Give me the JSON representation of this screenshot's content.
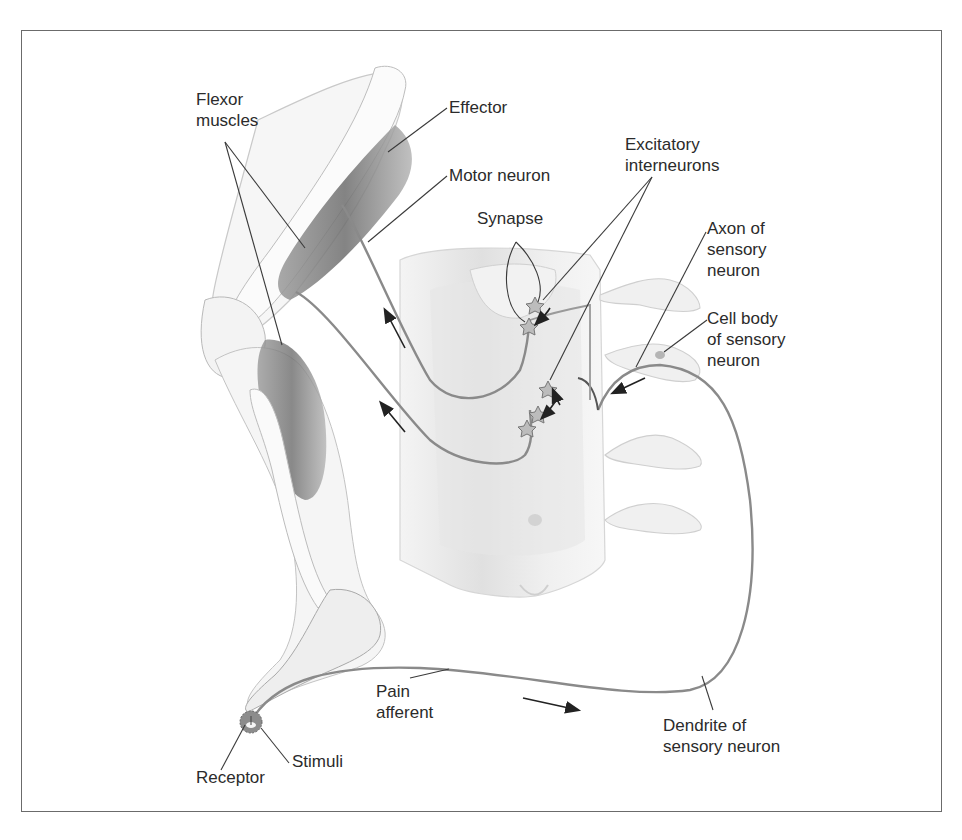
{
  "diagram": {
    "colors": {
      "frame": "#6b6b6b",
      "text": "#2b2b2b",
      "leader_line": "#3a3a3a",
      "neuron_path": "#8a8a8a",
      "muscle": "#7a7a7a",
      "bone": "#f2f2f2",
      "spinal_cord": "#ececec",
      "arrow": "#222222"
    },
    "labels": {
      "flexor_muscles_1": "Flexor",
      "flexor_muscles_2": "muscles",
      "effector": "Effector",
      "motor_neuron": "Motor neuron",
      "excitatory_1": "Excitatory",
      "excitatory_2": "interneurons",
      "synapse": "Synapse",
      "axon_1": "Axon of",
      "axon_2": "sensory",
      "axon_3": "neuron",
      "cell_body_1": "Cell body",
      "cell_body_2": "of sensory",
      "cell_body_3": "neuron",
      "pain_1": "Pain",
      "pain_2": "afferent",
      "dendrite_1": "Dendrite of",
      "dendrite_2": "sensory neuron",
      "receptor": "Receptor",
      "stimuli": "Stimuli"
    },
    "structures": [
      "leg (femur, knee, tibia, foot)",
      "flexor muscles",
      "spinal cord segment",
      "dorsal root ganglia",
      "receptor",
      "sensory neuron",
      "excitatory interneurons",
      "motor neurons"
    ],
    "signal_flow": [
      "Stimuli",
      "Receptor",
      "Pain afferent",
      "Dendrite of sensory neuron",
      "Cell body of sensory neuron",
      "Axon of sensory neuron",
      "Excitatory interneurons",
      "Synapse",
      "Motor neuron",
      "Effector"
    ]
  }
}
